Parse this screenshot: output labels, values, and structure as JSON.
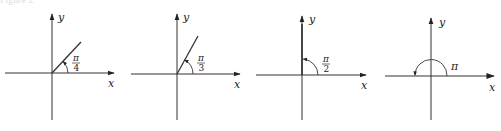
{
  "caption": "Figure 2",
  "colors": {
    "axis": "#333333",
    "ray": "#333333",
    "text": "#222222",
    "background": "#ffffff"
  },
  "panels": [
    {
      "id": "angle-pi-over-4",
      "angle_label": {
        "numerator": "π",
        "denominator": "4"
      },
      "angle_degrees": 45,
      "x_axis_label": "x",
      "y_axis_label": "y"
    },
    {
      "id": "angle-pi-over-3",
      "angle_label": {
        "numerator": "π",
        "denominator": "3"
      },
      "angle_degrees": 60,
      "x_axis_label": "x",
      "y_axis_label": "y"
    },
    {
      "id": "angle-pi-over-2",
      "angle_label": {
        "numerator": "π",
        "denominator": "2"
      },
      "angle_degrees": 90,
      "x_axis_label": "x",
      "y_axis_label": "y"
    },
    {
      "id": "angle-pi",
      "angle_label": {
        "text": "π"
      },
      "angle_degrees": 180,
      "x_axis_label": "x",
      "y_axis_label": "y"
    }
  ]
}
